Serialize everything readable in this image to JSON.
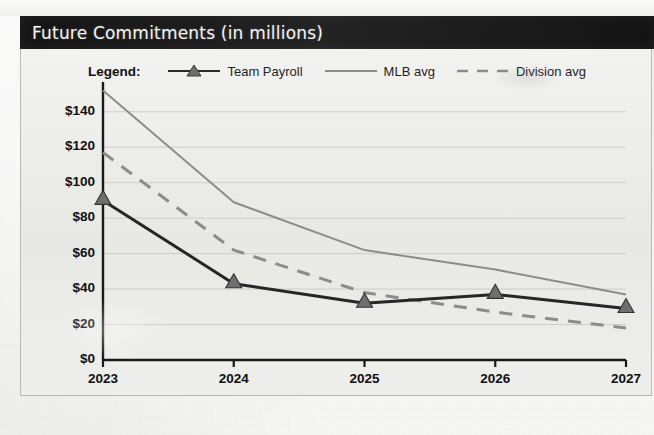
{
  "header": {
    "title": "Future Commitments (in millions)"
  },
  "legend": {
    "title_label": "Legend:",
    "items": [
      {
        "label": "Team Payroll",
        "marker": "triangle-line",
        "color": "#2b2b2b"
      },
      {
        "label": "MLB avg",
        "marker": "solid-line",
        "color": "#8b8b8b"
      },
      {
        "label": "Division avg",
        "marker": "dashed-line",
        "color": "#8b8b8b"
      }
    ]
  },
  "chart_data": {
    "type": "line",
    "title": "Future Commitments (in millions)",
    "xlabel": "",
    "ylabel": "",
    "x": [
      "2023",
      "2024",
      "2025",
      "2026",
      "2027"
    ],
    "categories": [
      "2023",
      "2024",
      "2025",
      "2026",
      "2027"
    ],
    "ylim": [
      0,
      150
    ],
    "ytick_values": [
      0,
      20,
      40,
      60,
      80,
      100,
      120,
      140
    ],
    "ytick_labels": [
      "$0",
      "$20",
      "$40",
      "$60",
      "$80",
      "$100",
      "$120",
      "$140"
    ],
    "grid": true,
    "grid_axis": "y",
    "legend_position": "top-center",
    "series": [
      {
        "name": "Team Payroll",
        "values": [
          90,
          43,
          32,
          37,
          29
        ],
        "style": "solid",
        "color": "#262626",
        "marker": "triangle",
        "linewidth": 3
      },
      {
        "name": "MLB avg",
        "values": [
          152,
          89,
          62,
          51,
          37
        ],
        "style": "solid",
        "color": "#8c8c8c",
        "marker": "none",
        "linewidth": 2
      },
      {
        "name": "Division avg",
        "values": [
          117,
          62,
          38,
          27,
          18
        ],
        "style": "dashed",
        "color": "#8c8c8c",
        "marker": "none",
        "linewidth": 3
      }
    ]
  },
  "colors": {
    "header_band": "#1b1b1b",
    "header_text": "#f2f2f2",
    "paper": "#ededea",
    "plot_bg": "#eeeeec",
    "axis": "#1a1a1a",
    "gridline": "#c9c9c4"
  }
}
